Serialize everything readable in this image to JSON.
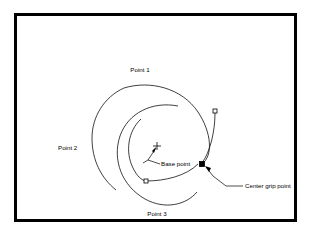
{
  "diagram": {
    "frame": {
      "border_color": "#000000",
      "background_color": "#ffffff",
      "border_width_px": 3
    },
    "labels": {
      "point1": "Point 1",
      "point2": "Point 2",
      "point3": "Point 3",
      "base_point": "Base point",
      "center_grip_point": "Center grip point"
    },
    "grips": [
      {
        "name": "upper-right-grip",
        "style": "hollow",
        "x": 215,
        "y": 111,
        "size": 4
      },
      {
        "name": "center-grip-point",
        "style": "filled",
        "x": 202,
        "y": 164,
        "size": 5
      },
      {
        "name": "lower-left-grip",
        "style": "hollow",
        "x": 146,
        "y": 181,
        "size": 4
      }
    ],
    "base_point_marker": {
      "name": "base-point-crosshair",
      "x": 157,
      "y": 146,
      "size": 8
    },
    "arcs": [
      {
        "name": "outer-arc",
        "label": "Point 1"
      },
      {
        "name": "middle-arc",
        "label": "Point 2"
      },
      {
        "name": "inner-arc",
        "label": "Point 3"
      }
    ],
    "colors": {
      "stroke": "#000000",
      "fill": "#ffffff"
    }
  }
}
